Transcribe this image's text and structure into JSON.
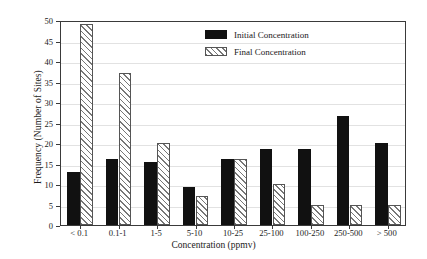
{
  "chart_data": {
    "type": "bar",
    "title": "",
    "xlabel": "Concentration (ppmv)",
    "ylabel": "Frequency (Number of Sites)",
    "ylim": [
      0,
      50
    ],
    "ytick_step": 5,
    "yticks": [
      0,
      5,
      10,
      15,
      20,
      25,
      30,
      35,
      40,
      45,
      50
    ],
    "grid": true,
    "grid_axis": "y",
    "legend_position": "top-right-inside",
    "categories": [
      "< 0.1",
      "0.1-1",
      "1-5",
      "5-10",
      "10-25",
      "25-100",
      "100-250",
      "250-500",
      "> 500"
    ],
    "series": [
      {
        "name": "Initial Concentration",
        "fill": "solid-black",
        "color": "#111111",
        "values": [
          13,
          16.2,
          15.3,
          9.3,
          16,
          18.5,
          18.5,
          26.5,
          20
        ]
      },
      {
        "name": "Final Concentration",
        "fill": "diagonal-hatch",
        "color": "#777777",
        "values": [
          49,
          37,
          20,
          7,
          16,
          10,
          5,
          5,
          5
        ]
      }
    ]
  },
  "legend": {
    "items": [
      {
        "label": "Initial Concentration",
        "swatch": "solid-black-swatch"
      },
      {
        "label": "Final Concentration",
        "swatch": "hatched-swatch"
      }
    ]
  },
  "colors": {
    "initial": "#111111",
    "final_hatch": "#777777",
    "axis": "#3a3a3a",
    "grid": "#e2e2e2",
    "background": "#ffffff"
  }
}
